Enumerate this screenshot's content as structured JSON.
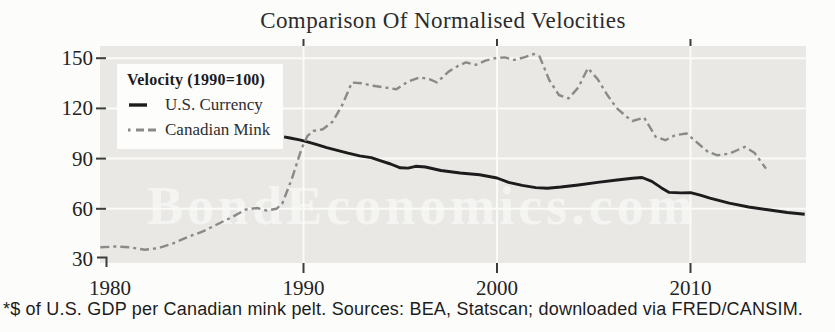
{
  "title": "Comparison Of Normalised Velocities",
  "footnote": "*$ of U.S. GDP per Canadian mink pelt. Sources: BEA, Statscan; downloaded via FRED/CANSIM.",
  "watermark": "BondEconomics.com",
  "colors": {
    "us_currency_line": "#1c1c1c",
    "canadian_mink_line": "#8a8a8a",
    "plot_background": "#e9e8e4",
    "gridline": "#fafaf7",
    "tick": "#3c3c3c"
  },
  "legend": {
    "title": "Velocity (1990=100)",
    "items": [
      {
        "label": "U.S. Currency",
        "style": "solid"
      },
      {
        "label": "Canadian Mink",
        "style": "dash-dot"
      }
    ]
  },
  "chart_data": {
    "type": "line",
    "title": "Comparison Of Normalised Velocities",
    "xlabel": "",
    "ylabel": "Velocity (1990=100)",
    "x_ticks": [
      1980,
      1990,
      2000,
      2010
    ],
    "y_ticks": [
      30,
      60,
      90,
      120,
      150
    ],
    "xlim": [
      1979.5,
      2016
    ],
    "ylim": [
      28,
      157
    ],
    "grid": true,
    "legend_position": "upper-left",
    "series": [
      {
        "name": "U.S. Currency",
        "style": "solid",
        "points": [
          [
            1989.0,
            103.0
          ],
          [
            1989.3,
            102.3
          ],
          [
            1989.8,
            101.2
          ],
          [
            1990.2,
            100.0
          ],
          [
            1990.7,
            98.3
          ],
          [
            1991.2,
            96.5
          ],
          [
            1991.8,
            94.8
          ],
          [
            1992.3,
            93.2
          ],
          [
            1992.9,
            91.6
          ],
          [
            1993.5,
            90.6
          ],
          [
            1994.0,
            88.6
          ],
          [
            1994.5,
            86.8
          ],
          [
            1995.0,
            84.5
          ],
          [
            1995.4,
            84.3
          ],
          [
            1995.8,
            85.4
          ],
          [
            1996.3,
            85.0
          ],
          [
            1997.1,
            82.9
          ],
          [
            1998.1,
            81.4
          ],
          [
            1999.1,
            80.3
          ],
          [
            2000.0,
            78.4
          ],
          [
            2000.6,
            75.8
          ],
          [
            2001.3,
            74.0
          ],
          [
            2002.0,
            72.7
          ],
          [
            2002.6,
            72.3
          ],
          [
            2003.3,
            73.0
          ],
          [
            2004.2,
            74.2
          ],
          [
            2005.2,
            75.8
          ],
          [
            2006.2,
            77.2
          ],
          [
            2007.0,
            78.2
          ],
          [
            2007.5,
            78.7
          ],
          [
            2008.0,
            76.4
          ],
          [
            2008.5,
            72.5
          ],
          [
            2008.9,
            69.8
          ],
          [
            2009.5,
            69.5
          ],
          [
            2010.0,
            69.7
          ],
          [
            2010.5,
            68.2
          ],
          [
            2011.0,
            66.4
          ],
          [
            2012.0,
            63.4
          ],
          [
            2013.0,
            61.1
          ],
          [
            2014.0,
            59.4
          ],
          [
            2015.0,
            57.8
          ],
          [
            2015.9,
            56.8
          ]
        ]
      },
      {
        "name": "Canadian Mink",
        "style": "dash-dot",
        "points": [
          [
            1979.5,
            37.0
          ],
          [
            1980.3,
            37.5
          ],
          [
            1981.0,
            37.0
          ],
          [
            1981.8,
            35.5
          ],
          [
            1982.5,
            36.5
          ],
          [
            1983.2,
            39.0
          ],
          [
            1984.0,
            43.0
          ],
          [
            1984.8,
            46.5
          ],
          [
            1985.5,
            50.5
          ],
          [
            1986.3,
            55.0
          ],
          [
            1987.0,
            59.5
          ],
          [
            1987.6,
            60.5
          ],
          [
            1988.1,
            59.0
          ],
          [
            1988.6,
            60.0
          ],
          [
            1988.9,
            63.0
          ],
          [
            1989.4,
            78.0
          ],
          [
            1989.9,
            96.0
          ],
          [
            1990.2,
            103.5
          ],
          [
            1990.5,
            106.5
          ],
          [
            1991.0,
            107.5
          ],
          [
            1991.5,
            112.0
          ],
          [
            1992.0,
            122.0
          ],
          [
            1992.5,
            135.5
          ],
          [
            1993.0,
            135.0
          ],
          [
            1993.6,
            133.5
          ],
          [
            1994.2,
            132.5
          ],
          [
            1994.8,
            131.5
          ],
          [
            1995.4,
            136.0
          ],
          [
            1996.0,
            138.5
          ],
          [
            1996.5,
            137.5
          ],
          [
            1996.9,
            135.5
          ],
          [
            1997.5,
            142.0
          ],
          [
            1998.0,
            145.5
          ],
          [
            1998.4,
            147.5
          ],
          [
            1998.9,
            146.0
          ],
          [
            1999.4,
            148.5
          ],
          [
            1999.9,
            150.0
          ],
          [
            2000.4,
            150.5
          ],
          [
            2000.9,
            149.0
          ],
          [
            2001.4,
            150.5
          ],
          [
            2001.9,
            152.5
          ],
          [
            2002.2,
            151.0
          ],
          [
            2002.7,
            137.0
          ],
          [
            2003.2,
            128.0
          ],
          [
            2003.7,
            126.0
          ],
          [
            2004.2,
            132.5
          ],
          [
            2004.7,
            144.0
          ],
          [
            2005.2,
            137.5
          ],
          [
            2005.7,
            128.0
          ],
          [
            2006.2,
            120.0
          ],
          [
            2006.7,
            115.0
          ],
          [
            2007.0,
            112.5
          ],
          [
            2007.6,
            114.5
          ],
          [
            2008.2,
            103.0
          ],
          [
            2008.7,
            101.0
          ],
          [
            2009.2,
            104.0
          ],
          [
            2009.8,
            105.0
          ],
          [
            2010.4,
            99.0
          ],
          [
            2010.9,
            94.0
          ],
          [
            2011.4,
            92.0
          ],
          [
            2012.0,
            93.0
          ],
          [
            2012.8,
            97.0
          ],
          [
            2013.3,
            93.5
          ],
          [
            2013.9,
            84.0
          ]
        ]
      }
    ]
  }
}
